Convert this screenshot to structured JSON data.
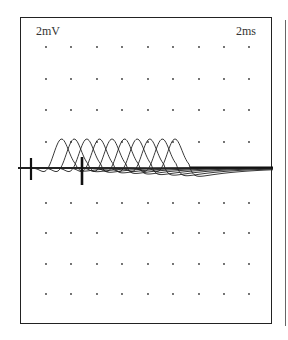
{
  "chart_data": {
    "type": "line",
    "title": "",
    "amplitude_scale_label": "2mV",
    "time_scale_label": "2ms",
    "xlabel": "",
    "ylabel": "",
    "grid": "dot",
    "grid_columns": 9,
    "grid_rows": 8,
    "series_count": 10,
    "stimulus_markers_ms": [
      0.9,
      4.9
    ],
    "series": [
      {
        "name": "trace-1",
        "peak_latency_ms": 3.3,
        "peak_amplitude_mV": 2.2
      },
      {
        "name": "trace-2",
        "peak_latency_ms": 4.3,
        "peak_amplitude_mV": 2.2
      },
      {
        "name": "trace-3",
        "peak_latency_ms": 5.3,
        "peak_amplitude_mV": 2.2
      },
      {
        "name": "trace-4",
        "peak_latency_ms": 6.3,
        "peak_amplitude_mV": 2.2
      },
      {
        "name": "trace-5",
        "peak_latency_ms": 7.3,
        "peak_amplitude_mV": 2.2
      },
      {
        "name": "trace-6",
        "peak_latency_ms": 8.3,
        "peak_amplitude_mV": 2.2
      },
      {
        "name": "trace-7",
        "peak_latency_ms": 9.3,
        "peak_amplitude_mV": 2.2
      },
      {
        "name": "trace-8",
        "peak_latency_ms": 10.3,
        "peak_amplitude_mV": 2.2
      },
      {
        "name": "trace-9",
        "peak_latency_ms": 11.3,
        "peak_amplitude_mV": 2.2
      },
      {
        "name": "trace-10",
        "peak_latency_ms": 12.3,
        "peak_amplitude_mV": 2.2
      }
    ]
  },
  "labels": {
    "amplitude": "2mV",
    "time": "2ms"
  },
  "colors": {
    "trace": "#222222",
    "frame": "#222222",
    "background": "#ffffff"
  }
}
